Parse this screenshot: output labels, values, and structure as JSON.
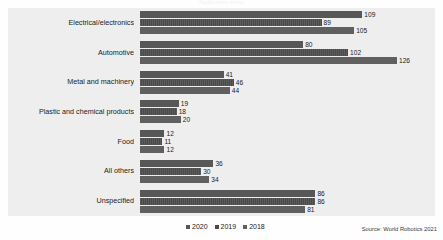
{
  "chart_data": {
    "type": "bar",
    "orientation": "horizontal",
    "title": "Application areas",
    "categories": [
      "Electrical/electronics",
      "Automotive",
      "Metal and machinery",
      "Plastic and chemical products",
      "Food",
      "All others",
      "Unspecified"
    ],
    "series": [
      {
        "name": "2020",
        "values": [
          109,
          80,
          41,
          19,
          12,
          36,
          86
        ]
      },
      {
        "name": "2019",
        "values": [
          89,
          102,
          46,
          18,
          11,
          30,
          86
        ]
      },
      {
        "name": "2018",
        "values": [
          105,
          126,
          44,
          20,
          12,
          34,
          81
        ]
      }
    ],
    "xlabel": "",
    "ylabel": "",
    "xlim": [
      0,
      126
    ],
    "grid": false,
    "legend_position": "bottom-center",
    "source": "Source: World Robotics 2021",
    "colors": {
      "s2020": "#575757",
      "s2019": "#4a4a4a",
      "s2018": "#606060",
      "plot_background": "#eeeeee"
    }
  },
  "legend": {
    "items": [
      {
        "label": "2020",
        "key": "s2020"
      },
      {
        "label": "2019",
        "key": "s2019"
      },
      {
        "label": "2018",
        "key": "s2018"
      }
    ]
  },
  "footer": {
    "source": "Source: World Robotics 2021"
  }
}
